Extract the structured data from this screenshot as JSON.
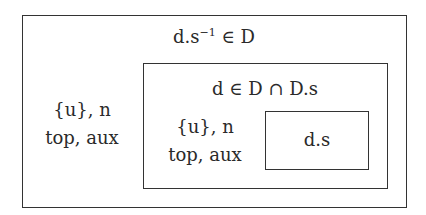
{
  "diagram": {
    "outer_box": {
      "title_base": "d.s",
      "title_sup": "−1",
      "title_rest": " ∈ D",
      "label_line1": "{u}, n",
      "label_line2": "top, aux"
    },
    "middle_box": {
      "title": "d ∈ D ∩ D.s",
      "label_line1": "{u}, n",
      "label_line2": "top, aux"
    },
    "inner_box": {
      "label": "d.s"
    }
  },
  "colors": {
    "border": "#333333",
    "text": "#2a2a2a",
    "background": "#ffffff"
  }
}
